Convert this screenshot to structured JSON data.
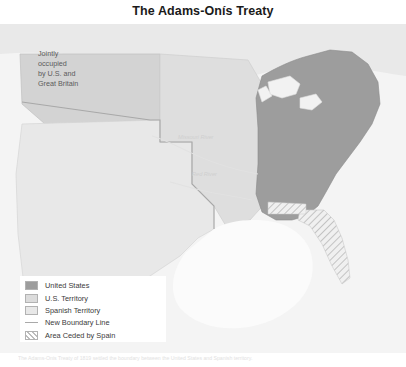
{
  "title": "The Adams-Onís Treaty",
  "map": {
    "name": "adams-onis-treaty-map",
    "background_color": "#f2f2f2",
    "ocean_color": "#f7f7f7",
    "labels": {
      "jointly_occupied": [
        "Jointly",
        "occupied",
        "by U.S. and",
        "Great Britain"
      ],
      "river_missouri": "Missouri River",
      "river_red": "Red River"
    },
    "regions": {
      "united_states_color": "#9a9a9a",
      "us_territory_color": "#d8d8d8",
      "spanish_territory_color": "#e4e4e4",
      "jointly_occupied_color": "#cdcdcd",
      "boundary_line_color": "#a9a9a9",
      "ceded_hatch_color": "#bdbdbd"
    }
  },
  "legend": {
    "name": "map-legend",
    "items": [
      {
        "label": "United States",
        "swatch": "fill",
        "color": "#9a9a9a"
      },
      {
        "label": "U.S. Territory",
        "swatch": "fill",
        "color": "#dcdcdc"
      },
      {
        "label": "Spanish Territory",
        "swatch": "fill",
        "color": "#e6e6e6"
      },
      {
        "label": "New Boundary Line",
        "swatch": "line",
        "color": "#a9a9a9"
      },
      {
        "label": "Area Ceded by Spain",
        "swatch": "hatch",
        "color": "#c4c4c4"
      }
    ]
  },
  "caption": "The Adams-Onis Treaty of 1819 settled the boundary between the United States and Spanish territory."
}
